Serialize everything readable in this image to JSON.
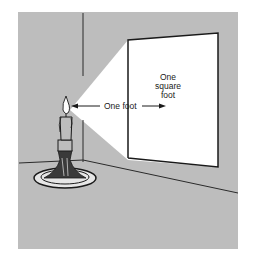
{
  "figure": {
    "labels": {
      "distance": "One foot",
      "area_line1": "One",
      "area_line2": "square",
      "area_line3": "foot"
    },
    "colors": {
      "background": "#ffffff",
      "panel": "#bdbdbd",
      "light": "#ffffff",
      "ink": "#1a1a1a"
    }
  }
}
